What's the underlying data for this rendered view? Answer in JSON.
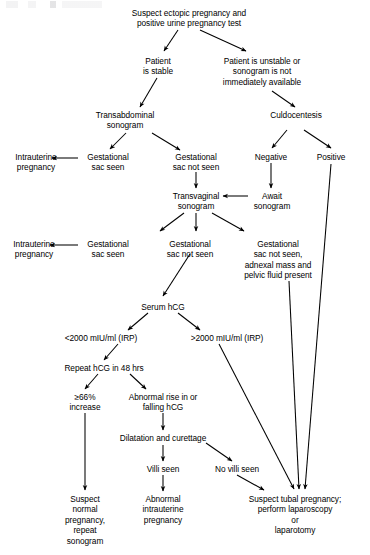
{
  "diagram": {
    "type": "clinical-decision-flowchart",
    "width": 370,
    "height": 555,
    "line_color": "#000000",
    "text_color": "#000000",
    "background": "#ffffff"
  },
  "nodes": {
    "start": "Suspect ectopic pregnancy and\npositive urine pregnancy test",
    "stable": "Patient\nis stable",
    "unstable": "Patient is unstable or\nsonogram is not\nimmediately available",
    "transabdominal": "Transabdominal\nsonogram",
    "culdocentesis": "Culdocentesis",
    "iup1": "Intrauterine\npregnancy",
    "sac_seen1": "Gestational\nsac seen",
    "sac_not_seen1": "Gestational\nsac not seen",
    "negative": "Negative",
    "positive": "Positive",
    "transvaginal": "Transvaginal\nsonogram",
    "await": "Await\nsonogram",
    "iup2": "Intrauterine\npregnancy",
    "sac_seen2": "Gestational\nsac seen",
    "sac_not_seen2": "Gestational\nsac not seen",
    "adnexal": "Gestational\nsac not seen,\nadnexal mass and\npelvic fluid present",
    "serum_hcg": "Serum hCG",
    "hcg_low": "<2000 mIU/ml (IRP)",
    "hcg_high": ">2000 mIU/ml (IRP)",
    "repeat_hcg": "Repeat hCG in 48 hrs",
    "increase66": "≥66%\nincrease",
    "abnormal_rise": "Abnormal rise in or\nfalling hCG",
    "dnc": "Dilatation and curettage",
    "villi_seen": "Villi seen",
    "no_villi": "No villi seen",
    "normal_preg": "Suspect\nnormal\npregnancy,\nrepeat\nsonogram",
    "abnormal_iup": "Abnormal\nintrauterine\npregnancy",
    "tubal": "Suspect tubal pregnancy;\nperform laparoscopy\nor\nlaparotomy"
  },
  "edges": [
    {
      "from": "start",
      "to": "stable",
      "style": "arrow"
    },
    {
      "from": "start",
      "to": "unstable",
      "style": "arrow"
    },
    {
      "from": "stable",
      "to": "transabdominal",
      "style": "arrow"
    },
    {
      "from": "unstable",
      "to": "culdocentesis",
      "style": "arrow"
    },
    {
      "from": "transabdominal",
      "to": "sac_seen1",
      "style": "arrow"
    },
    {
      "from": "transabdominal",
      "to": "sac_not_seen1",
      "style": "arrow"
    },
    {
      "from": "sac_seen1",
      "to": "iup1",
      "style": "arrow"
    },
    {
      "from": "culdocentesis",
      "to": "negative",
      "style": "arrow"
    },
    {
      "from": "culdocentesis",
      "to": "positive",
      "style": "arrow"
    },
    {
      "from": "sac_not_seen1",
      "to": "transvaginal",
      "style": "arrow"
    },
    {
      "from": "negative",
      "to": "await",
      "style": "arrow"
    },
    {
      "from": "await",
      "to": "transvaginal",
      "style": "arrow"
    },
    {
      "from": "transvaginal",
      "to": "sac_seen2",
      "style": "arrow"
    },
    {
      "from": "transvaginal",
      "to": "sac_not_seen2",
      "style": "arrow"
    },
    {
      "from": "transvaginal",
      "to": "adnexal",
      "style": "arrow"
    },
    {
      "from": "sac_seen2",
      "to": "iup2",
      "style": "arrow"
    },
    {
      "from": "sac_not_seen2",
      "to": "serum_hcg",
      "style": "arrow"
    },
    {
      "from": "serum_hcg",
      "to": "hcg_low",
      "style": "arrow"
    },
    {
      "from": "serum_hcg",
      "to": "hcg_high",
      "style": "arrow"
    },
    {
      "from": "hcg_low",
      "to": "repeat_hcg",
      "style": "arrow"
    },
    {
      "from": "repeat_hcg",
      "to": "increase66",
      "style": "arrow"
    },
    {
      "from": "repeat_hcg",
      "to": "abnormal_rise",
      "style": "arrow"
    },
    {
      "from": "abnormal_rise",
      "to": "dnc",
      "style": "arrow"
    },
    {
      "from": "dnc",
      "to": "villi_seen",
      "style": "arrow"
    },
    {
      "from": "dnc",
      "to": "no_villi",
      "style": "arrow"
    },
    {
      "from": "increase66",
      "to": "normal_preg",
      "style": "arrow"
    },
    {
      "from": "villi_seen",
      "to": "abnormal_iup",
      "style": "arrow"
    },
    {
      "from": "no_villi",
      "to": "tubal",
      "style": "arrow"
    },
    {
      "from": "hcg_high",
      "to": "tubal",
      "style": "arrow"
    },
    {
      "from": "adnexal",
      "to": "tubal",
      "style": "arrow"
    },
    {
      "from": "positive",
      "to": "tubal",
      "style": "arrow"
    }
  ]
}
